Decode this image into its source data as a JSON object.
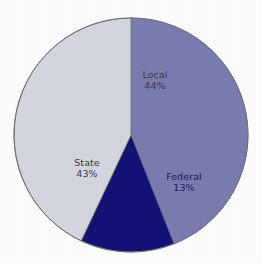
{
  "chart_data": {
    "type": "pie",
    "title": "",
    "subtitle": "",
    "labels": [
      "Local",
      "Federal",
      "State"
    ],
    "values": [
      44,
      13,
      43
    ],
    "value_suffix": "%",
    "legend": false,
    "grid": false,
    "colors": {
      "local": "#7b7caf",
      "federal": "#131376",
      "state": "#d4d7e0",
      "outline": "#6f6f78",
      "background": "#fefefe",
      "label_text": "#3b3b42",
      "label_text_on_dark": "#1a1a60"
    },
    "slices": [
      {
        "name": "local",
        "label": "Local",
        "value_text": "44%",
        "value": 44,
        "color": "#7b7caf",
        "start_angle": 0,
        "end_angle": 158.4,
        "label_x": 155,
        "label_y": 78,
        "value_x": 155,
        "value_y": 89,
        "text_on_dark": false
      },
      {
        "name": "federal",
        "label": "Federal",
        "value_text": "13%",
        "value": 13,
        "color": "#131376",
        "start_angle": 158.4,
        "end_angle": 205.2,
        "label_x": 184,
        "label_y": 180,
        "value_x": 184,
        "value_y": 191,
        "text_on_dark": true
      },
      {
        "name": "state",
        "label": "State",
        "value_text": "43%",
        "value": 43,
        "color": "#d4d7e0",
        "start_angle": 205.2,
        "end_angle": 360,
        "label_x": 87,
        "label_y": 166,
        "value_x": 87,
        "value_y": 177,
        "text_on_dark": false
      }
    ],
    "geometry": {
      "center_x": 131,
      "center_y": 135,
      "radius": 117
    }
  }
}
